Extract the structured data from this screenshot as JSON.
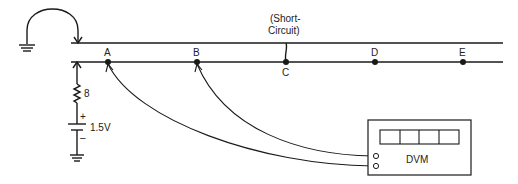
{
  "diagram": {
    "nodes": [
      {
        "id": "A",
        "label": "A",
        "x": 108
      },
      {
        "id": "B",
        "label": "B",
        "x": 197
      },
      {
        "id": "C",
        "label": "C",
        "x": 286
      },
      {
        "id": "D",
        "label": "D",
        "x": 375
      },
      {
        "id": "E",
        "label": "E",
        "x": 463
      }
    ],
    "short_circuit_label_line1": "(Short-",
    "short_circuit_label_line2": "Circuit)",
    "resistor_label": "8",
    "battery_label": "1.5V",
    "battery_plus": "+",
    "battery_minus": "–",
    "meter_label": "DVM",
    "meter_display_digits": 4,
    "colors": {
      "line": "#1a1a1a",
      "background": "#ffffff"
    }
  }
}
